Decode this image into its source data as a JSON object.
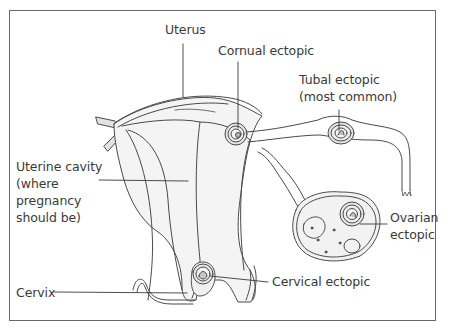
{
  "diagram": {
    "labels": {
      "uterus": "Uterus",
      "cornual": "Cornual ectopic",
      "tubal_line1": "Tubal ectopic",
      "tubal_line2": "(most common)",
      "cavity_line1": "Uterine cavity",
      "cavity_line2": "(where",
      "cavity_line3": "pregnancy",
      "cavity_line4": "should be)",
      "ovarian_line1": "Ovarian",
      "ovarian_line2": "ectopic",
      "cervical": "Cervical ectopic",
      "cervix": "Cervix"
    },
    "colors": {
      "stroke": "#4a4a4a",
      "shade": "#d9d9d9",
      "border": "#6a6a6a",
      "text": "#3a3a3a"
    }
  }
}
